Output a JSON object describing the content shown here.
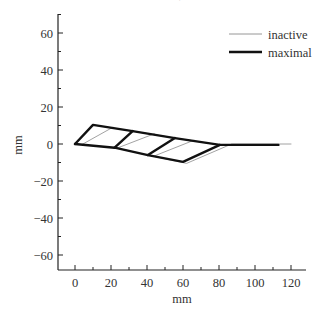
{
  "chart_data": {
    "type": "line",
    "title": "",
    "xlabel": "mm",
    "ylabel": "mm",
    "xlim": [
      -9,
      128
    ],
    "ylim": [
      -68,
      70
    ],
    "xticks": [
      0,
      20,
      40,
      60,
      80,
      100,
      120
    ],
    "yticks": [
      -60,
      -40,
      -20,
      0,
      20,
      40,
      60
    ],
    "xtick_labels": [
      "0",
      "20",
      "40",
      "60",
      "80",
      "100",
      "120"
    ],
    "ytick_labels": [
      "−60",
      "−40",
      "−20",
      "0",
      "20",
      "40",
      "60"
    ],
    "grid": false,
    "legend_position": "upper right",
    "series": [
      {
        "name": "inactive",
        "style": "thin",
        "color": "#8a8a8a",
        "segments": [
          [
            [
              0,
              0
            ],
            [
              10,
              10.3
            ],
            [
              32,
              7
            ],
            [
              55.5,
              3.2
            ],
            [
              80.5,
              -0.5
            ]
          ],
          [
            [
              0,
              0
            ],
            [
              22,
              -2
            ],
            [
              40.5,
              -6
            ],
            [
              62,
              -10.5
            ],
            [
              87,
              0
            ],
            [
              120,
              0
            ]
          ],
          [
            [
              4,
              -0.2
            ],
            [
              21,
              9
            ]
          ],
          [
            [
              24,
              -2
            ],
            [
              44,
              5.5
            ]
          ],
          [
            [
              44,
              -6.5
            ],
            [
              66,
              2
            ]
          ],
          [
            [
              22,
              -2
            ],
            [
              32,
              7
            ]
          ],
          [
            [
              40.5,
              -6
            ],
            [
              55.5,
              3.2
            ]
          ]
        ]
      },
      {
        "name": "maximal",
        "style": "thick",
        "color": "#111111",
        "segments": [
          [
            [
              0,
              0
            ],
            [
              10,
              10.3
            ],
            [
              32,
              7
            ],
            [
              55.5,
              3.2
            ],
            [
              80.5,
              -0.5
            ],
            [
              113,
              -0.5
            ]
          ],
          [
            [
              0,
              0
            ],
            [
              22,
              -2
            ],
            [
              40.5,
              -6
            ],
            [
              60,
              -9.7
            ],
            [
              80.5,
              -0.5
            ]
          ],
          [
            [
              22,
              -2
            ],
            [
              32,
              7
            ]
          ],
          [
            [
              40.5,
              -6
            ],
            [
              55.5,
              3.2
            ]
          ]
        ]
      }
    ]
  },
  "legend": {
    "items": [
      {
        "label": "inactive",
        "style": "thin"
      },
      {
        "label": "maximal",
        "style": "thick"
      }
    ]
  },
  "labels": {
    "xlabel": "mm",
    "ylabel": "mm"
  }
}
